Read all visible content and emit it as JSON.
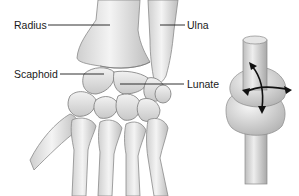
{
  "figure": {
    "labels": {
      "radius": "Radius",
      "ulna": "Ulna",
      "scaphoid": "Scaphoid",
      "lunate": "Lunate"
    },
    "colors": {
      "bone_light": "#f2f2f2",
      "bone_mid": "#d4d4d4",
      "bone_shadow": "#9a9a9a",
      "outline": "#6e6e6e",
      "leader_line": "#1a1a1a",
      "arrow": "#111111",
      "background": "#ffffff"
    },
    "joint_model": {
      "description": "ellipsoid joint model with biaxial motion arrows",
      "arrow_icon": "four-way-curved-arrows-icon"
    }
  }
}
